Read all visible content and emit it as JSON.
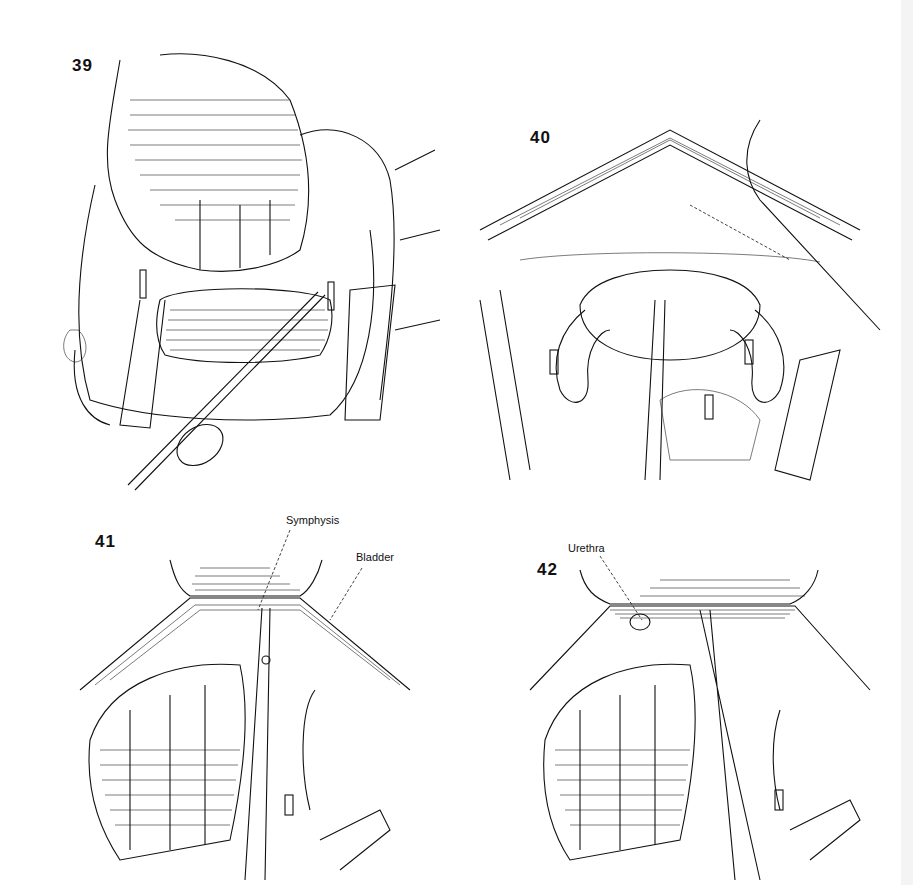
{
  "page": {
    "background": "#ffffff",
    "ink_color": "#111111"
  },
  "figures": [
    {
      "number": "39",
      "labels": []
    },
    {
      "number": "40",
      "labels": []
    },
    {
      "number": "41",
      "labels": [
        {
          "text": "Symphysis"
        },
        {
          "text": "Bladder"
        }
      ]
    },
    {
      "number": "42",
      "labels": [
        {
          "text": "Urethra"
        }
      ]
    }
  ]
}
